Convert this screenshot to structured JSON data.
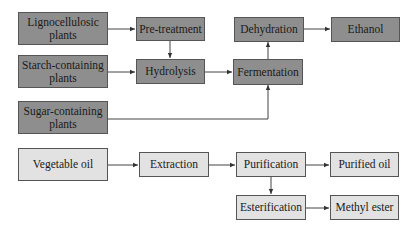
{
  "diagram": {
    "colors": {
      "dark_box": "#8e8e8e",
      "light_box": "#e2e2e2",
      "line": "#444444"
    },
    "ethanol_pathway": {
      "lignocellulosic": "Lignocellulosic plants",
      "starch": "Starch-containing plants",
      "sugar": "Sugar-containing plants",
      "pretreatment": "Pre-treatment",
      "hydrolysis": "Hydrolysis",
      "fermentation": "Fermentation",
      "dehydration": "Dehydration",
      "ethanol": "Ethanol"
    },
    "oil_pathway": {
      "vegetable_oil": "Vegetable oil",
      "extraction": "Extraction",
      "purification": "Purification",
      "purified_oil": "Purified oil",
      "esterification": "Esterification",
      "methyl_ester": "Methyl ester"
    },
    "edges": [
      [
        "Lignocellulosic plants",
        "Pre-treatment"
      ],
      [
        "Pre-treatment",
        "Hydrolysis"
      ],
      [
        "Starch-containing plants",
        "Hydrolysis"
      ],
      [
        "Hydrolysis",
        "Fermentation"
      ],
      [
        "Sugar-containing plants",
        "Fermentation"
      ],
      [
        "Fermentation",
        "Dehydration"
      ],
      [
        "Dehydration",
        "Ethanol"
      ],
      [
        "Vegetable oil",
        "Extraction"
      ],
      [
        "Extraction",
        "Purification"
      ],
      [
        "Purification",
        "Purified oil"
      ],
      [
        "Purification",
        "Esterification"
      ],
      [
        "Esterification",
        "Methyl ester"
      ]
    ]
  }
}
